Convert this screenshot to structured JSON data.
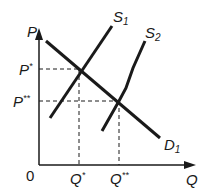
{
  "diagram": {
    "type": "supply-demand",
    "axes": {
      "y_label": "P",
      "x_label": "Q",
      "origin_label": "0"
    },
    "curves": [
      {
        "id": "S1",
        "label_main": "S",
        "label_sub": "1",
        "kind": "supply"
      },
      {
        "id": "S2",
        "label_main": "S",
        "label_sub": "2",
        "kind": "supply"
      },
      {
        "id": "D1",
        "label_main": "D",
        "label_sub": "1",
        "kind": "demand"
      }
    ],
    "equilibria": [
      {
        "price_main": "P",
        "price_sup": "*",
        "qty_main": "Q",
        "qty_sup": "*"
      },
      {
        "price_main": "P",
        "price_sup": "**",
        "qty_main": "Q",
        "qty_sup": "**"
      }
    ],
    "colors": {
      "line": "#1a1a1a",
      "background": "#ffffff"
    }
  }
}
